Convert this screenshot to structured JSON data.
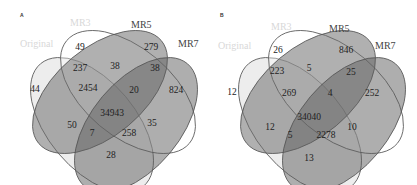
{
  "colors": {
    "original_fill": "#e9e9e9",
    "mr3_fill": "#ffffff",
    "mr5_fill": "#7a7a7a",
    "mr7_fill": "#6e6e6e",
    "outline": "#555555",
    "faint_label": "#d8d8d8"
  },
  "sets": [
    "Original",
    "MR3",
    "MR5",
    "MR7"
  ],
  "panels": [
    {
      "letter": "A",
      "labels": {
        "original": "Original",
        "mr3": "MR3",
        "mr5": "MR5",
        "mr7": "MR7"
      },
      "regions": {
        "original_only": "44",
        "mr3_only": "49",
        "mr5_only": "279",
        "mr7_only": "824",
        "original_mr3": "237",
        "mr3_mr5": "38",
        "mr5_mr7": "38",
        "original_mr3_mr5": "2454",
        "mr3_mr5_mr7": "20",
        "all": "34943",
        "original_mr7": "50",
        "original_mr5_mr7": "7",
        "original_mr3_mr7": "258",
        "mr3_mr7": "35",
        "original_mr5": "28"
      }
    },
    {
      "letter": "B",
      "labels": {
        "original": "Original",
        "mr3": "MR3",
        "mr5": "MR5",
        "mr7": "MR7"
      },
      "regions": {
        "original_only": "12",
        "mr3_only": "26",
        "mr5_only": "846",
        "mr7_only": "252",
        "original_mr3": "223",
        "mr3_mr5": "5",
        "mr5_mr7": "25",
        "original_mr3_mr5": "269",
        "mr3_mr5_mr7": "4",
        "all": "34040",
        "original_mr7": "12",
        "original_mr5_mr7": "5",
        "original_mr3_mr7": "2278",
        "mr3_mr7": "10",
        "original_mr5": "13"
      }
    }
  ]
}
